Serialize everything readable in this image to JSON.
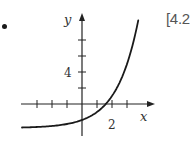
{
  "problem": {
    "bullet": "•",
    "reference": "[4.2"
  },
  "chart_data": {
    "type": "line",
    "title": "",
    "xlabel": "x",
    "ylabel": "y",
    "x_tick_labels": [
      {
        "value": 2,
        "label": "2"
      }
    ],
    "y_tick_labels": [
      {
        "value": 4,
        "label": "4"
      }
    ],
    "x_ticks": [
      -3,
      -2,
      -1,
      1,
      2,
      3
    ],
    "y_ticks": [
      2,
      4,
      6,
      8
    ],
    "xlim": [
      -4.1,
      4.9
    ],
    "ylim": [
      -3.5,
      11.4
    ],
    "grid": false,
    "legend": null,
    "series": [
      {
        "name": "y = 2^x - 3 (exponential curve, horizontal asymptote y = -3)",
        "x": [
          -4,
          -3,
          -2,
          -1,
          0,
          1,
          1.585,
          2,
          2.5,
          3,
          3.5,
          3.75
        ],
        "y": [
          -2.94,
          -2.88,
          -2.75,
          -2.5,
          -2,
          -1,
          0,
          1,
          2.66,
          5,
          8.31,
          10.45
        ]
      }
    ],
    "colors": {
      "curve": "#1a1a1a",
      "axes": "#222222",
      "labels": "#333333"
    }
  }
}
